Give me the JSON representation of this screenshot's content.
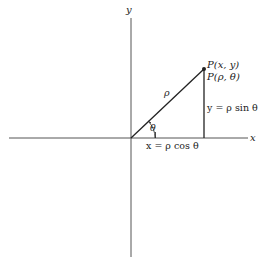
{
  "diagram": {
    "type": "polar-cartesian-relationship",
    "axes": {
      "x_label": "x",
      "y_label": "y"
    },
    "point": {
      "label_cartesian": "P(x, y)",
      "label_polar": "P(ρ, θ)"
    },
    "segments": {
      "radius_label": "ρ",
      "angle_label": "θ",
      "horizontal_eq": "x = ρ cos θ",
      "vertical_eq": "y = ρ sin θ"
    },
    "colors": {
      "line": "#222222",
      "axis": "#555555",
      "background": "#ffffff"
    }
  }
}
